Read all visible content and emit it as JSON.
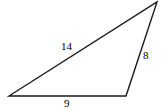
{
  "figure": {
    "type": "triangle-diagram",
    "background_color": "#ffffff",
    "stroke_color": "#1a1a1a",
    "text_color": "#000000",
    "stroke_width": 1.4,
    "canvas": {
      "width": 162,
      "height": 111
    },
    "vertices": {
      "left": {
        "name": "bottom-left-vertex",
        "x": 9,
        "y": 96
      },
      "bottom_right": {
        "name": "bottom-right-vertex",
        "x": 126,
        "y": 96
      },
      "apex": {
        "name": "top-right-apex",
        "x": 157,
        "y": 2
      }
    },
    "sides": [
      {
        "id": "long-side",
        "name": "side-label-14",
        "label": "14",
        "from": "left",
        "to": "apex",
        "label_position": {
          "x": 61,
          "y": 41
        }
      },
      {
        "id": "right-side",
        "name": "side-label-8",
        "label": "8",
        "from": "apex",
        "to": "bottom_right",
        "label_position": {
          "x": 143,
          "y": 50
        }
      },
      {
        "id": "base-side",
        "name": "side-label-9",
        "label": "9",
        "from": "left",
        "to": "bottom_right",
        "label_position": {
          "x": 64,
          "y": 98
        }
      }
    ]
  }
}
